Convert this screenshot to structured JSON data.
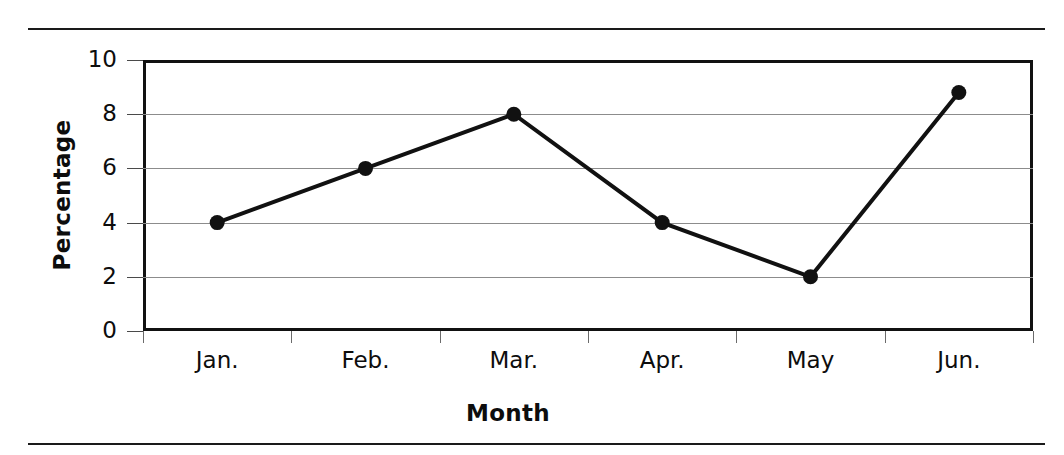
{
  "chart_data": {
    "type": "line",
    "title": "",
    "xlabel": "Month",
    "ylabel": "Percentage",
    "categories": [
      "Jan.",
      "Feb.",
      "Mar.",
      "Apr.",
      "May",
      "Jun."
    ],
    "values": [
      4,
      6,
      8,
      4,
      2,
      8.8
    ],
    "series": [
      {
        "name": "Percentage",
        "values": [
          4,
          6,
          8,
          4,
          2,
          8.8
        ]
      }
    ],
    "ylim": [
      0,
      10
    ],
    "ytick_labels": [
      "0",
      "2",
      "4",
      "6",
      "8",
      "10"
    ],
    "ytick_values": [
      0,
      2,
      4,
      6,
      8,
      10
    ],
    "grid": "horizontal",
    "legend": "none",
    "marker": "filled-circle",
    "line_color": "#111111",
    "marker_color": "#111111",
    "grid_color": "#8c8c8c",
    "frame_color": "#111111",
    "background": "#ffffff"
  },
  "figure": {
    "top_rule": "horizontal-rule",
    "bottom_rule": "horizontal-rule"
  }
}
